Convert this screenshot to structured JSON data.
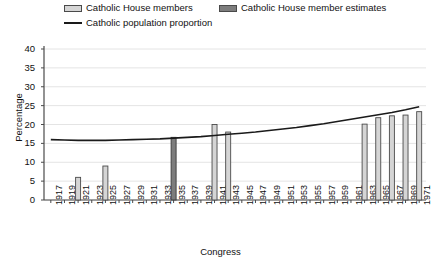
{
  "chart_data": {
    "type": "bar",
    "title": "",
    "xlabel": "Congress",
    "ylabel": "Percentage",
    "ylim": [
      0,
      40
    ],
    "ytick_step": 5,
    "yticks": [
      "0",
      "5",
      "10",
      "15",
      "20",
      "25",
      "30",
      "35",
      "40"
    ],
    "grid": true,
    "legend_position": "top-left",
    "categories": [
      "1917",
      "1919",
      "1921",
      "1923",
      "1925",
      "1927",
      "1929",
      "1931",
      "1933",
      "1935",
      "1937",
      "1939",
      "1941",
      "1943",
      "1945",
      "1947",
      "1949",
      "1951",
      "1953",
      "1955",
      "1957",
      "1959",
      "1961",
      "1963",
      "1965",
      "1967",
      "1969",
      "1971"
    ],
    "series": [
      {
        "name": "Catholic House members",
        "kind": "bar",
        "color": "#d5d5d5",
        "border": "#4a4a4a",
        "values": [
          null,
          null,
          6.0,
          null,
          9.0,
          null,
          null,
          null,
          null,
          null,
          null,
          null,
          20.0,
          18.0,
          null,
          null,
          null,
          null,
          null,
          null,
          null,
          null,
          null,
          20.1,
          21.8,
          22.3,
          22.5,
          23.4
        ]
      },
      {
        "name": "Catholic House member estimates",
        "kind": "bar",
        "color": "#7d7d7d",
        "border": "#3a3a3a",
        "values": [
          null,
          null,
          null,
          null,
          null,
          null,
          null,
          null,
          null,
          16.6,
          null,
          null,
          null,
          null,
          null,
          null,
          null,
          null,
          null,
          null,
          null,
          null,
          null,
          null,
          null,
          null,
          null,
          null
        ]
      },
      {
        "name": "Catholic population proportion",
        "kind": "line",
        "color": "#1a1a1a",
        "values": [
          16.0,
          15.9,
          15.8,
          15.8,
          15.8,
          15.9,
          16.0,
          16.1,
          16.2,
          16.4,
          16.6,
          16.8,
          17.1,
          17.4,
          17.7,
          18.0,
          18.4,
          18.8,
          19.2,
          19.7,
          20.2,
          20.8,
          21.4,
          22.0,
          22.6,
          23.2,
          23.9,
          24.7
        ]
      }
    ]
  },
  "legend": {
    "items": [
      {
        "label": "Catholic House members",
        "marker": "swatch-light"
      },
      {
        "label": "Catholic House member estimates",
        "marker": "swatch-dark"
      },
      {
        "label": "Catholic population proportion",
        "marker": "line"
      }
    ]
  },
  "axes": {
    "y_title": "Percentage",
    "x_title": "Congress"
  }
}
